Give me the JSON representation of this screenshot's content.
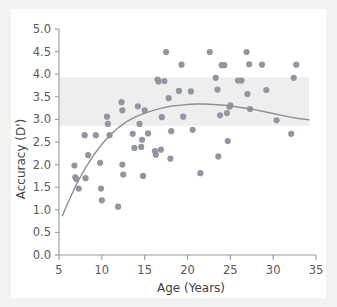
{
  "chart_data": {
    "type": "scatter",
    "title": "",
    "xlabel": "Age (Years)",
    "ylabel": "Accuracy (D')",
    "xlim": [
      5,
      35
    ],
    "ylim": [
      0.0,
      5.0
    ],
    "xticks": [
      5,
      10,
      15,
      20,
      25,
      30,
      35
    ],
    "xtick_labels": [
      "5",
      "10",
      "15",
      "20",
      "25",
      "30",
      "35"
    ],
    "yticks": [
      0.0,
      0.5,
      1.0,
      1.5,
      2.0,
      2.5,
      3.0,
      3.5,
      4.0,
      4.5,
      5.0
    ],
    "ytick_labels": [
      "0.0",
      "0.5",
      "1.0",
      "1.5",
      "2.0",
      "2.5",
      "3.0",
      "3.5",
      "4.0",
      "4.5",
      "5.0"
    ],
    "grid": false,
    "legend": null,
    "marker_color": "#9296a0",
    "curve_color": "#8d8f94",
    "band_color": "#eeeeee",
    "band": {
      "label": "normative-range-band",
      "ymin": 2.86,
      "ymax": 3.93,
      "xmin": 5.0,
      "xmax": 34.2
    },
    "series": [
      {
        "name": "Participants",
        "type": "scatter",
        "points": [
          [
            6.8,
            1.98
          ],
          [
            6.9,
            1.72
          ],
          [
            7.0,
            1.68
          ],
          [
            7.3,
            1.47
          ],
          [
            8.0,
            2.65
          ],
          [
            8.1,
            1.7
          ],
          [
            8.4,
            2.21
          ],
          [
            9.3,
            2.65
          ],
          [
            9.8,
            2.04
          ],
          [
            9.9,
            1.47
          ],
          [
            10.0,
            1.21
          ],
          [
            10.6,
            3.06
          ],
          [
            10.7,
            2.9
          ],
          [
            10.9,
            2.65
          ],
          [
            11.9,
            1.07
          ],
          [
            12.3,
            3.38
          ],
          [
            12.4,
            3.2
          ],
          [
            12.4,
            2.0
          ],
          [
            12.5,
            1.78
          ],
          [
            13.6,
            2.68
          ],
          [
            13.8,
            2.37
          ],
          [
            14.2,
            3.29
          ],
          [
            14.4,
            2.9
          ],
          [
            14.6,
            2.39
          ],
          [
            14.7,
            2.55
          ],
          [
            14.8,
            1.75
          ],
          [
            15.0,
            3.2
          ],
          [
            15.4,
            2.69
          ],
          [
            16.2,
            2.3
          ],
          [
            16.3,
            2.22
          ],
          [
            16.5,
            3.88
          ],
          [
            16.6,
            3.84
          ],
          [
            16.9,
            2.33
          ],
          [
            17.0,
            3.05
          ],
          [
            17.3,
            3.85
          ],
          [
            17.5,
            4.49
          ],
          [
            17.8,
            3.47
          ],
          [
            18.0,
            2.13
          ],
          [
            18.1,
            2.74
          ],
          [
            19.0,
            3.63
          ],
          [
            19.3,
            4.21
          ],
          [
            19.5,
            3.06
          ],
          [
            20.4,
            3.62
          ],
          [
            20.6,
            2.77
          ],
          [
            21.5,
            1.81
          ],
          [
            22.6,
            4.49
          ],
          [
            23.3,
            3.92
          ],
          [
            23.5,
            3.66
          ],
          [
            23.6,
            2.18
          ],
          [
            23.8,
            3.09
          ],
          [
            24.0,
            4.2
          ],
          [
            24.3,
            4.2
          ],
          [
            24.6,
            3.14
          ],
          [
            24.7,
            2.52
          ],
          [
            24.9,
            3.28
          ],
          [
            25.0,
            3.31
          ],
          [
            25.9,
            3.86
          ],
          [
            26.3,
            3.86
          ],
          [
            26.9,
            4.49
          ],
          [
            27.0,
            3.56
          ],
          [
            27.2,
            4.22
          ],
          [
            27.3,
            3.23
          ],
          [
            28.7,
            4.21
          ],
          [
            29.2,
            3.65
          ],
          [
            30.4,
            2.98
          ],
          [
            32.1,
            2.68
          ],
          [
            32.4,
            3.92
          ],
          [
            32.7,
            4.21
          ]
        ]
      },
      {
        "name": "Fitted trend",
        "type": "line",
        "points": [
          [
            5.4,
            0.87
          ],
          [
            6.0,
            1.14
          ],
          [
            7.0,
            1.55
          ],
          [
            8.0,
            1.9
          ],
          [
            9.0,
            2.2
          ],
          [
            10.0,
            2.45
          ],
          [
            11.0,
            2.66
          ],
          [
            12.0,
            2.83
          ],
          [
            13.0,
            2.96
          ],
          [
            14.0,
            3.06
          ],
          [
            15.0,
            3.14
          ],
          [
            16.0,
            3.2
          ],
          [
            17.0,
            3.25
          ],
          [
            18.0,
            3.29
          ],
          [
            19.0,
            3.31
          ],
          [
            20.0,
            3.33
          ],
          [
            21.0,
            3.34
          ],
          [
            22.0,
            3.34
          ],
          [
            23.0,
            3.33
          ],
          [
            24.0,
            3.32
          ],
          [
            25.0,
            3.3
          ],
          [
            26.0,
            3.27
          ],
          [
            27.0,
            3.24
          ],
          [
            28.0,
            3.21
          ],
          [
            29.0,
            3.17
          ],
          [
            30.0,
            3.13
          ],
          [
            31.0,
            3.09
          ],
          [
            32.0,
            3.05
          ],
          [
            33.0,
            3.02
          ],
          [
            34.2,
            2.99
          ]
        ]
      }
    ]
  }
}
